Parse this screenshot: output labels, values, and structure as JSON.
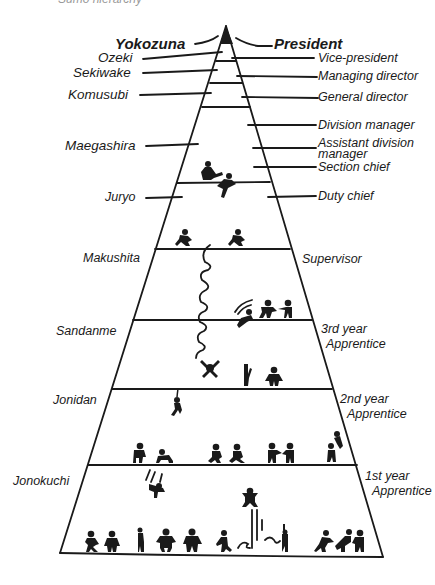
{
  "caption": "Sumo hierarchy",
  "pyramid": {
    "apex": [
      226,
      26
    ],
    "base_left": [
      60,
      553
    ],
    "base_right": [
      383,
      557
    ],
    "ink_color": "#1a1a1a",
    "background": "#ffffff"
  },
  "left_labels": [
    {
      "text": "Yokozuna",
      "bold": true
    },
    {
      "text": "Ozeki"
    },
    {
      "text": "Sekiwake"
    },
    {
      "text": "Komusubi"
    },
    {
      "text": "Maegashira"
    },
    {
      "text": "Juryo"
    },
    {
      "text": "Makushita"
    },
    {
      "text": "Sandanme"
    },
    {
      "text": "Jonidan"
    },
    {
      "text": "Jonokuchi"
    }
  ],
  "right_labels": [
    {
      "text": "President",
      "bold": true
    },
    {
      "text": "Vice-president"
    },
    {
      "text": "Managing director"
    },
    {
      "text": "General director"
    },
    {
      "text": "Division manager"
    },
    {
      "text": "Assistant division manager",
      "line1": "Assistant division",
      "line2": "manager"
    },
    {
      "text": "Section chief"
    },
    {
      "text": "Duty chief"
    },
    {
      "text": "Supervisor"
    },
    {
      "text": "3rd year Apprentice",
      "line1": "3rd year",
      "line2": "Apprentice"
    },
    {
      "text": "2nd year Apprentice",
      "line1": "2nd year",
      "line2": "Apprentice"
    },
    {
      "text": "1st year Apprentice",
      "line1": "1st year",
      "line2": "Apprentice"
    }
  ]
}
